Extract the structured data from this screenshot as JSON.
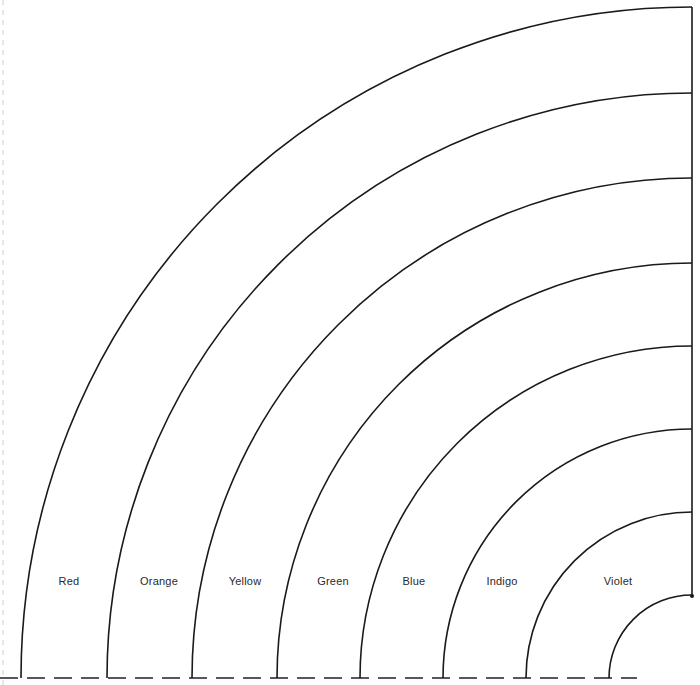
{
  "diagram": {
    "type": "concentric-quarter-rainbow-bands",
    "bands": [
      {
        "label": "Red"
      },
      {
        "label": "Orange"
      },
      {
        "label": "Yellow"
      },
      {
        "label": "Green"
      },
      {
        "label": "Blue"
      },
      {
        "label": "Indigo"
      },
      {
        "label": "Violet"
      }
    ],
    "line_color": "#1a1a1a",
    "background": "#ffffff"
  }
}
